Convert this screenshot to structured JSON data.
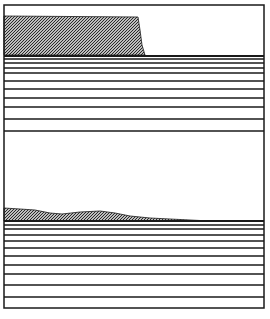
{
  "colors": {
    "background": "#ffffff",
    "line": "#1a1a1a",
    "shade_fg": "#2a2a2a",
    "shade_bg": "#bdbdbd"
  },
  "frame": {
    "x": 4,
    "y": 5,
    "width": 260,
    "height": 303
  },
  "panels": [
    {
      "name": "upper-panel",
      "top": 5,
      "bottom": 131,
      "base_line_y": 56,
      "layer_lines_y": [
        59,
        63,
        68,
        73,
        81,
        89,
        98,
        107,
        119
      ],
      "shaded_deposit": {
        "points": [
          [
            4,
            16
          ],
          [
            138,
            17
          ],
          [
            140,
            30
          ],
          [
            142,
            45
          ],
          [
            145,
            55
          ],
          [
            4,
            55
          ]
        ]
      }
    },
    {
      "name": "lower-panel",
      "top": 131,
      "bottom": 308,
      "base_line_y": 221,
      "layer_lines_y": [
        225,
        229,
        235,
        241,
        248,
        256,
        265,
        274,
        285,
        297
      ],
      "shaded_deposit": {
        "points": [
          [
            4,
            208
          ],
          [
            20,
            209
          ],
          [
            35,
            210
          ],
          [
            50,
            213
          ],
          [
            62,
            214
          ],
          [
            80,
            212
          ],
          [
            100,
            211
          ],
          [
            115,
            213
          ],
          [
            130,
            216
          ],
          [
            150,
            218
          ],
          [
            170,
            219
          ],
          [
            190,
            220
          ],
          [
            210,
            221
          ],
          [
            4,
            221
          ]
        ]
      }
    }
  ]
}
